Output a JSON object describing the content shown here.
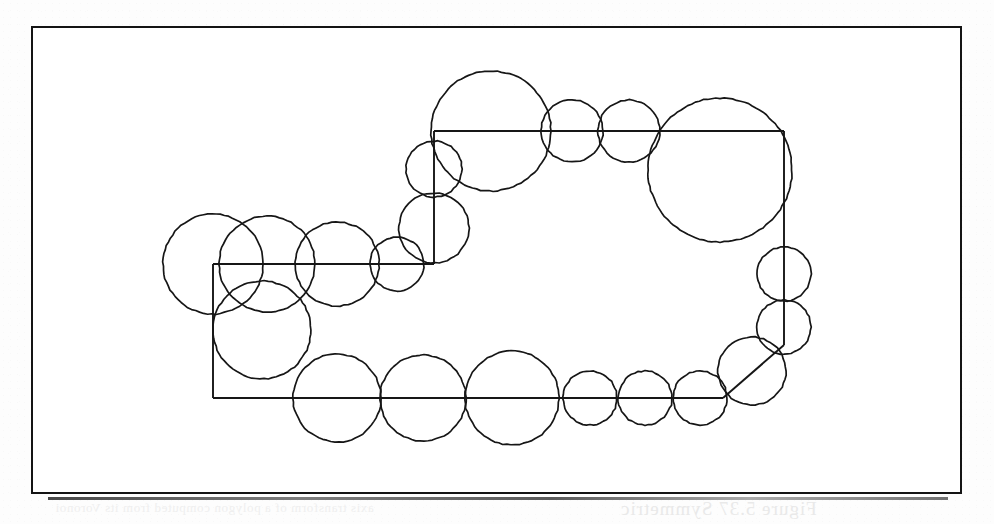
{
  "page": {
    "kind": "scanned-book-figure",
    "background_color": "#fdfdfd",
    "ink_color": "#161616",
    "width": 994,
    "height": 524
  },
  "figure": {
    "frame": {
      "x": 31,
      "y": 26,
      "width": 931,
      "height": 468,
      "border_color": "#141414",
      "border_width": 2.2
    },
    "path_color": "#161616",
    "circle_color": "#161616"
  },
  "chart_data": {
    "type": "scatter",
    "title": "",
    "subtitle": "",
    "xlabel": "",
    "ylabel": "",
    "grid": false,
    "legend_position": "none",
    "xlim": [
      31,
      962
    ],
    "ylim": [
      26,
      494
    ],
    "skeleton_path": {
      "name": "medial-axis-polyline",
      "closed": false,
      "vertices": [
        [
          213,
          264
        ],
        [
          434,
          264
        ],
        [
          434,
          131
        ],
        [
          784,
          131
        ],
        [
          784,
          345
        ],
        [
          723,
          398
        ],
        [
          213,
          398
        ],
        [
          213,
          264
        ]
      ],
      "segments": [
        {
          "name": "upper-left-horizontal",
          "from": [
            213,
            264
          ],
          "to": [
            434,
            264
          ],
          "orientation": "horizontal"
        },
        {
          "name": "left-riser-vertical",
          "from": [
            434,
            264
          ],
          "to": [
            434,
            131
          ],
          "orientation": "vertical"
        },
        {
          "name": "top-horizontal",
          "from": [
            434,
            131
          ],
          "to": [
            784,
            131
          ],
          "orientation": "horizontal"
        },
        {
          "name": "right-vertical",
          "from": [
            784,
            131
          ],
          "to": [
            784,
            345
          ],
          "orientation": "vertical"
        },
        {
          "name": "lower-right-diagonal",
          "from": [
            784,
            345
          ],
          "to": [
            723,
            398
          ],
          "orientation": "diagonal"
        },
        {
          "name": "bottom-horizontal",
          "from": [
            723,
            398
          ],
          "to": [
            213,
            398
          ],
          "orientation": "horizontal"
        },
        {
          "name": "left-vertical",
          "from": [
            213,
            398
          ],
          "to": [
            213,
            264
          ],
          "orientation": "vertical"
        }
      ]
    },
    "circles": [
      {
        "id": 1,
        "cx": 213,
        "cy": 264,
        "r": 50
      },
      {
        "id": 2,
        "cx": 267,
        "cy": 264,
        "r": 48
      },
      {
        "id": 3,
        "cx": 337,
        "cy": 264,
        "r": 42
      },
      {
        "id": 4,
        "cx": 397,
        "cy": 264,
        "r": 27
      },
      {
        "id": 5,
        "cx": 434,
        "cy": 228,
        "r": 35
      },
      {
        "id": 6,
        "cx": 434,
        "cy": 169,
        "r": 28
      },
      {
        "id": 7,
        "cx": 491,
        "cy": 131,
        "r": 60
      },
      {
        "id": 8,
        "cx": 572,
        "cy": 131,
        "r": 31
      },
      {
        "id": 9,
        "cx": 629,
        "cy": 131,
        "r": 31
      },
      {
        "id": 10,
        "cx": 720,
        "cy": 170,
        "r": 72
      },
      {
        "id": 11,
        "cx": 784,
        "cy": 274,
        "r": 27
      },
      {
        "id": 12,
        "cx": 784,
        "cy": 327,
        "r": 27
      },
      {
        "id": 13,
        "cx": 752,
        "cy": 371,
        "r": 34
      },
      {
        "id": 14,
        "cx": 700,
        "cy": 398,
        "r": 27
      },
      {
        "id": 15,
        "cx": 645,
        "cy": 398,
        "r": 27
      },
      {
        "id": 16,
        "cx": 590,
        "cy": 398,
        "r": 27
      },
      {
        "id": 17,
        "cx": 512,
        "cy": 398,
        "r": 47
      },
      {
        "id": 18,
        "cx": 423,
        "cy": 398,
        "r": 43
      },
      {
        "id": 19,
        "cx": 337,
        "cy": 398,
        "r": 44
      },
      {
        "id": 20,
        "cx": 262,
        "cy": 330,
        "r": 49
      }
    ]
  },
  "bleed_through": {
    "caption_right": "Figure 5.37   Symmetric",
    "caption_left": "axis transform of a polygon computed from its Voronoi",
    "caption_top": "the set of maximal inscribed disks of the region"
  }
}
